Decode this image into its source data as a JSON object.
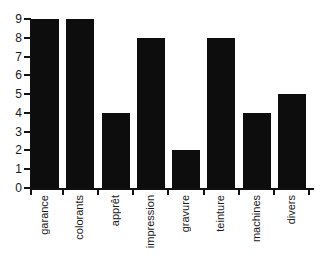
{
  "chart_data": {
    "type": "bar",
    "title": "",
    "subtitle": "",
    "xlabel": "",
    "ylabel": "",
    "categories": [
      "garance",
      "colorants",
      "apprêt",
      "impression",
      "gravure",
      "teinture",
      "machines",
      "divers"
    ],
    "values": [
      9,
      9,
      4,
      8,
      2,
      8,
      4,
      5
    ],
    "ylim": [
      0,
      9
    ],
    "xlim": [
      0,
      8
    ],
    "y_ticks": [
      0,
      1,
      2,
      3,
      4,
      5,
      6,
      7,
      8,
      9
    ],
    "y_tick_labels": [
      "0",
      "1",
      "2",
      "3",
      "4",
      "5",
      "6",
      "7",
      "8",
      "9"
    ],
    "grid": false,
    "legend": null,
    "legend_position": "none",
    "annotations": [],
    "bar_color": "#0d0d0d",
    "axis_color": "#111111",
    "background_color": "#ffffff",
    "text_color": "#1a1a1a",
    "x_tick_label_rotation": 90
  },
  "figure": {
    "plot_left_px": 31,
    "plot_right_px": 313,
    "plot_top_px": 19,
    "baseline_px": 188
  }
}
